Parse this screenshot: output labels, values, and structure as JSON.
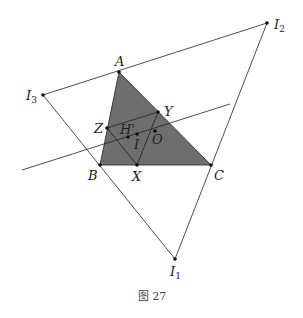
{
  "figure": {
    "caption": "图 27",
    "colors": {
      "fill": "#6e6e6e",
      "line": "#222222",
      "point": "#111111"
    },
    "points": {
      "A": {
        "label": "A",
        "x": 119,
        "y": 72
      },
      "B": {
        "label": "B",
        "x": 100,
        "y": 165
      },
      "C": {
        "label": "C",
        "x": 211,
        "y": 165
      },
      "X": {
        "label": "X",
        "x": 137,
        "y": 165
      },
      "Y": {
        "label": "Y",
        "x": 158,
        "y": 112
      },
      "Z": {
        "label": "Z",
        "x": 107,
        "y": 128
      },
      "H'": {
        "label": "H'",
        "x": 128,
        "y": 137
      },
      "I": {
        "label": "I",
        "x": 137,
        "y": 134
      },
      "O": {
        "label": "O",
        "x": 155,
        "y": 131
      },
      "I1": {
        "label": "I",
        "sub": "1",
        "x": 175,
        "y": 259
      },
      "I2": {
        "label": "I",
        "sub": "2",
        "x": 267,
        "y": 23
      },
      "I3": {
        "label": "I",
        "sub": "3",
        "x": 43,
        "y": 95
      }
    },
    "labels": {
      "A": "A",
      "B": "B",
      "C": "C",
      "X": "X",
      "Y": "Y",
      "Z": "Z",
      "Hp": "H'",
      "I": "I",
      "O": "O",
      "I1_main": "I",
      "I1_sub": "1",
      "I2_main": "I",
      "I2_sub": "2",
      "I3_main": "I",
      "I3_sub": "3"
    }
  }
}
